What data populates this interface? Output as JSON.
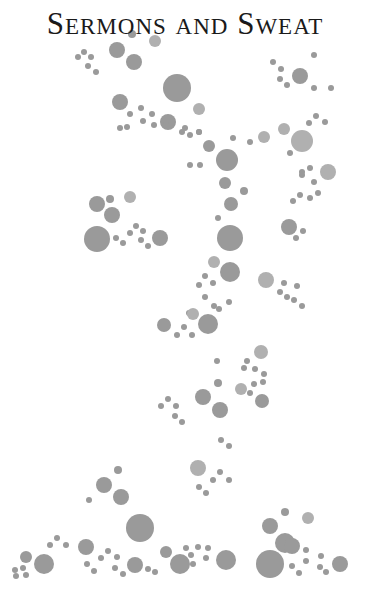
{
  "title": {
    "words": [
      {
        "cap": "S",
        "rest": "ERMONS"
      },
      {
        "cap": "",
        "rest": "AND"
      },
      {
        "cap": "S",
        "rest": "WEAT"
      }
    ],
    "full_text": "Sermons and Sweat",
    "color": "#1a1a1a"
  },
  "dot_color": "#9a9a9a",
  "background_color": "#ffffff",
  "dots": [
    [
      78,
      57,
      3,
      ""
    ],
    [
      84,
      52,
      3,
      ""
    ],
    [
      91,
      57,
      3,
      ""
    ],
    [
      88,
      66,
      3,
      ""
    ],
    [
      96,
      72,
      3,
      ""
    ],
    [
      117,
      50,
      8,
      ""
    ],
    [
      134,
      62,
      8,
      ""
    ],
    [
      155,
      41,
      6,
      "light"
    ],
    [
      132,
      34,
      4,
      ""
    ],
    [
      177,
      88,
      14,
      ""
    ],
    [
      199,
      109,
      6,
      "light"
    ],
    [
      120,
      102,
      8,
      ""
    ],
    [
      141,
      108,
      3,
      ""
    ],
    [
      152,
      114,
      3,
      ""
    ],
    [
      130,
      114,
      3,
      ""
    ],
    [
      120,
      128,
      3,
      ""
    ],
    [
      127,
      127,
      3,
      ""
    ],
    [
      143,
      121,
      3,
      ""
    ],
    [
      154,
      125,
      3,
      ""
    ],
    [
      168,
      122,
      8,
      ""
    ],
    [
      182,
      132,
      3,
      ""
    ],
    [
      199,
      132,
      3,
      ""
    ],
    [
      185,
      128,
      3,
      ""
    ],
    [
      166,
      123,
      3,
      ""
    ],
    [
      273,
      62,
      3,
      ""
    ],
    [
      281,
      69,
      3,
      ""
    ],
    [
      280,
      79,
      3,
      ""
    ],
    [
      287,
      85,
      3,
      ""
    ],
    [
      300,
      76,
      8,
      ""
    ],
    [
      314,
      55,
      3,
      ""
    ],
    [
      314,
      88,
      3,
      ""
    ],
    [
      331,
      88,
      3,
      ""
    ],
    [
      190,
      135,
      3,
      ""
    ],
    [
      199,
      132,
      3,
      ""
    ],
    [
      209,
      146,
      6,
      ""
    ],
    [
      227,
      160,
      11,
      ""
    ],
    [
      233,
      138,
      3,
      ""
    ],
    [
      250,
      142,
      3,
      ""
    ],
    [
      264,
      137,
      6,
      "light"
    ],
    [
      284,
      129,
      6,
      "light"
    ],
    [
      302,
      141,
      11,
      "light"
    ],
    [
      290,
      153,
      3,
      ""
    ],
    [
      309,
      123,
      3,
      ""
    ],
    [
      316,
      116,
      3,
      ""
    ],
    [
      325,
      122,
      3,
      ""
    ],
    [
      302,
      172,
      3,
      ""
    ],
    [
      310,
      168,
      3,
      ""
    ],
    [
      328,
      172,
      8,
      "light"
    ],
    [
      200,
      165,
      3,
      ""
    ],
    [
      225,
      183,
      6,
      ""
    ],
    [
      190,
      165,
      3,
      ""
    ],
    [
      302,
      175,
      3,
      ""
    ],
    [
      314,
      182,
      3,
      ""
    ],
    [
      293,
      201,
      3,
      ""
    ],
    [
      300,
      195,
      3,
      ""
    ],
    [
      310,
      198,
      3,
      ""
    ],
    [
      318,
      193,
      3,
      ""
    ],
    [
      244,
      191,
      4,
      ""
    ],
    [
      231,
      204,
      7,
      ""
    ],
    [
      218,
      218,
      3,
      ""
    ],
    [
      230,
      238,
      13,
      ""
    ],
    [
      289,
      227,
      8,
      ""
    ],
    [
      303,
      231,
      3,
      ""
    ],
    [
      296,
      238,
      3,
      ""
    ],
    [
      110,
      199,
      4,
      ""
    ],
    [
      130,
      197,
      6,
      "light"
    ],
    [
      97,
      204,
      8,
      ""
    ],
    [
      112,
      215,
      8,
      ""
    ],
    [
      97,
      239,
      13,
      ""
    ],
    [
      116,
      238,
      3,
      ""
    ],
    [
      123,
      243,
      3,
      ""
    ],
    [
      130,
      233,
      3,
      ""
    ],
    [
      136,
      226,
      3,
      ""
    ],
    [
      143,
      231,
      3,
      ""
    ],
    [
      141,
      240,
      3,
      ""
    ],
    [
      148,
      246,
      3,
      ""
    ],
    [
      160,
      238,
      8,
      ""
    ],
    [
      214,
      262,
      6,
      "light"
    ],
    [
      230,
      272,
      10,
      ""
    ],
    [
      205,
      276,
      3,
      ""
    ],
    [
      213,
      283,
      3,
      ""
    ],
    [
      199,
      285,
      3,
      ""
    ],
    [
      266,
      280,
      8,
      "light"
    ],
    [
      284,
      283,
      3,
      ""
    ],
    [
      297,
      286,
      3,
      ""
    ],
    [
      280,
      292,
      3,
      ""
    ],
    [
      287,
      297,
      3,
      ""
    ],
    [
      294,
      300,
      3,
      ""
    ],
    [
      302,
      306,
      3,
      ""
    ],
    [
      205,
      297,
      3,
      ""
    ],
    [
      214,
      306,
      3,
      ""
    ],
    [
      189,
      313,
      3,
      ""
    ],
    [
      229,
      302,
      3,
      ""
    ],
    [
      219,
      309,
      3,
      ""
    ],
    [
      164,
      325,
      7,
      ""
    ],
    [
      184,
      327,
      3,
      ""
    ],
    [
      177,
      335,
      3,
      ""
    ],
    [
      192,
      335,
      3,
      ""
    ],
    [
      193,
      314,
      6,
      "light"
    ],
    [
      208,
      324,
      10,
      ""
    ],
    [
      261,
      352,
      7,
      "light"
    ],
    [
      247,
      361,
      3,
      ""
    ],
    [
      244,
      368,
      3,
      ""
    ],
    [
      255,
      369,
      3,
      ""
    ],
    [
      264,
      374,
      3,
      ""
    ],
    [
      217,
      361,
      3,
      ""
    ],
    [
      254,
      384,
      3,
      ""
    ],
    [
      263,
      382,
      3,
      ""
    ],
    [
      250,
      393,
      3,
      ""
    ],
    [
      241,
      389,
      6,
      "light"
    ],
    [
      262,
      401,
      7,
      ""
    ],
    [
      218,
      383,
      4,
      ""
    ],
    [
      203,
      397,
      8,
      ""
    ],
    [
      220,
      410,
      8,
      ""
    ],
    [
      168,
      399,
      3,
      ""
    ],
    [
      161,
      406,
      3,
      ""
    ],
    [
      176,
      406,
      3,
      ""
    ],
    [
      175,
      416,
      3,
      ""
    ],
    [
      182,
      422,
      3,
      ""
    ],
    [
      221,
      440,
      3,
      ""
    ],
    [
      229,
      446,
      3,
      ""
    ],
    [
      198,
      468,
      8,
      "light"
    ],
    [
      220,
      472,
      3,
      ""
    ],
    [
      213,
      480,
      3,
      ""
    ],
    [
      229,
      480,
      3,
      ""
    ],
    [
      199,
      487,
      3,
      ""
    ],
    [
      206,
      493,
      3,
      ""
    ],
    [
      118,
      470,
      4,
      ""
    ],
    [
      104,
      485,
      8,
      ""
    ],
    [
      121,
      497,
      8,
      ""
    ],
    [
      89,
      500,
      3,
      ""
    ],
    [
      140,
      528,
      14,
      ""
    ],
    [
      26,
      575,
      3,
      ""
    ],
    [
      16,
      576,
      3,
      ""
    ],
    [
      15,
      570,
      3,
      ""
    ],
    [
      23,
      568,
      3,
      ""
    ],
    [
      26,
      557,
      6,
      ""
    ],
    [
      44,
      564,
      10,
      ""
    ],
    [
      50,
      545,
      3,
      ""
    ],
    [
      57,
      538,
      3,
      ""
    ],
    [
      66,
      545,
      3,
      ""
    ],
    [
      86,
      547,
      8,
      ""
    ],
    [
      101,
      558,
      3,
      ""
    ],
    [
      108,
      551,
      3,
      ""
    ],
    [
      117,
      557,
      3,
      ""
    ],
    [
      87,
      564,
      3,
      ""
    ],
    [
      94,
      571,
      3,
      ""
    ],
    [
      115,
      568,
      3,
      ""
    ],
    [
      123,
      574,
      3,
      ""
    ],
    [
      135,
      565,
      8,
      ""
    ],
    [
      155,
      572,
      3,
      ""
    ],
    [
      148,
      569,
      3,
      ""
    ],
    [
      166,
      552,
      6,
      ""
    ],
    [
      186,
      548,
      3,
      ""
    ],
    [
      180,
      564,
      10,
      ""
    ],
    [
      193,
      564,
      3,
      ""
    ],
    [
      191,
      555,
      3,
      ""
    ],
    [
      198,
      547,
      3,
      ""
    ],
    [
      208,
      548,
      3,
      ""
    ],
    [
      206,
      558,
      3,
      ""
    ],
    [
      226,
      560,
      10,
      ""
    ],
    [
      270,
      526,
      8,
      ""
    ],
    [
      285,
      512,
      4,
      ""
    ],
    [
      308,
      518,
      6,
      "light"
    ],
    [
      285,
      543,
      10,
      ""
    ],
    [
      292,
      546,
      8,
      ""
    ],
    [
      270,
      564,
      14,
      ""
    ],
    [
      292,
      566,
      3,
      ""
    ],
    [
      299,
      573,
      3,
      ""
    ],
    [
      306,
      550,
      3,
      ""
    ],
    [
      306,
      561,
      3,
      ""
    ],
    [
      321,
      556,
      3,
      ""
    ],
    [
      320,
      567,
      3,
      ""
    ],
    [
      326,
      572,
      3,
      ""
    ],
    [
      340,
      564,
      8,
      ""
    ]
  ]
}
